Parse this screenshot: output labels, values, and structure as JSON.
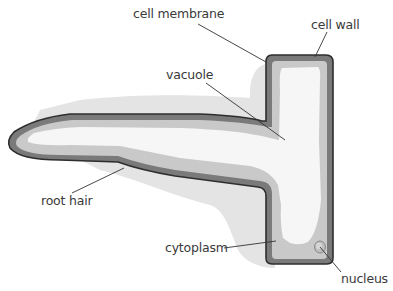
{
  "diagram": {
    "labels": {
      "cell_membrane": "cell membrane",
      "cell_wall": "cell wall",
      "vacuole": "vacuole",
      "root_hair": "root hair",
      "cytoplasm": "cytoplasm",
      "nucleus": "nucleus"
    },
    "colors": {
      "cell_wall": "#707070",
      "cell_wall_outline": "#2e2e2e",
      "cytoplasm": "#c8c8c8",
      "vacuole": "#f7f7f7",
      "shadow": "#e2e2e2",
      "leader_line": "#333333",
      "text": "#3a3a3a"
    }
  }
}
